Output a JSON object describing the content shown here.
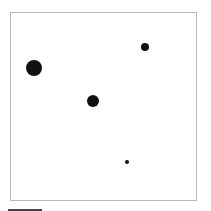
{
  "diagram": {
    "type": "dot-field",
    "frame": {
      "x": 10,
      "y": 12,
      "width": 187,
      "height": 189,
      "border_color": "#b8b8b8"
    },
    "dots": [
      {
        "id": "large",
        "cx": 34,
        "cy": 68,
        "r": 8,
        "color": "#111111"
      },
      {
        "id": "top-right",
        "cx": 145,
        "cy": 47,
        "r": 4,
        "color": "#111111"
      },
      {
        "id": "middle",
        "cx": 93,
        "cy": 101,
        "r": 6,
        "color": "#111111"
      },
      {
        "id": "small",
        "cx": 127,
        "cy": 162,
        "r": 2,
        "color": "#111111"
      }
    ],
    "scale_bar": {
      "x": 8,
      "y": 209,
      "length": 34,
      "color": "#444444"
    }
  }
}
